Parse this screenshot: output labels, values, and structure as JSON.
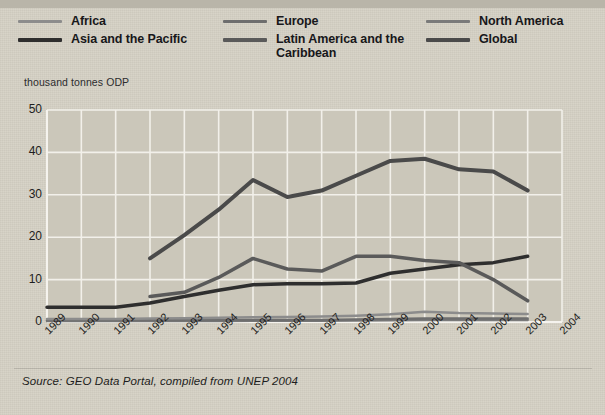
{
  "legend": {
    "columns": [
      [
        {
          "label": "Africa",
          "color": "#8c8c8c",
          "width": 3
        },
        {
          "label": "Asia and the Pacific",
          "color": "#2e2e2e",
          "width": 4
        }
      ],
      [
        {
          "label": "Europe",
          "color": "#6e6e6e",
          "width": 3
        },
        {
          "label": "Latin America and the\nCaribbean",
          "color": "#5a5a5a",
          "width": 4
        }
      ],
      [
        {
          "label": "North America",
          "color": "#7a7a7a",
          "width": 3
        },
        {
          "label": "Global",
          "color": "#4a4a4a",
          "width": 4
        }
      ]
    ]
  },
  "axis_unit": "thousand tonnes ODP",
  "source": "Source: GEO Data Portal, compiled from UNEP 2004",
  "chart_data": {
    "type": "line",
    "title": "",
    "subtitle": "",
    "xlabel": "",
    "ylabel": "thousand tonnes ODP",
    "ylim": [
      0,
      50
    ],
    "yticks": [
      0,
      10,
      20,
      30,
      40,
      50
    ],
    "grid": true,
    "legend_position": "top",
    "x": [
      1989,
      1990,
      1991,
      1992,
      1993,
      1994,
      1995,
      1996,
      1997,
      1998,
      1999,
      2000,
      2001,
      2002,
      2003,
      2004
    ],
    "xticks": [
      "1989",
      "1990",
      "1991",
      "1992",
      "1993",
      "1994",
      "1995",
      "1996",
      "1997",
      "1998",
      "1999",
      "2000",
      "2001",
      "2002",
      "2003",
      "2004"
    ],
    "series": [
      {
        "name": "Global",
        "color": "#4a4a4a",
        "width": 4,
        "x": [
          1992,
          1993,
          1994,
          1995,
          1996,
          1997,
          1998,
          1999,
          2000,
          2001,
          2002,
          2003
        ],
        "values": [
          15.0,
          20.5,
          26.5,
          33.5,
          29.5,
          31.0,
          34.5,
          38.0,
          38.5,
          36.0,
          35.5,
          31.0
        ]
      },
      {
        "name": "Latin America and the Caribbean",
        "color": "#5a5a5a",
        "width": 3.5,
        "x": [
          1992,
          1993,
          1994,
          1995,
          1996,
          1997,
          1998,
          1999,
          2000,
          2001,
          2002,
          2003
        ],
        "values": [
          6.0,
          7.0,
          10.5,
          15.0,
          12.5,
          12.0,
          15.5,
          15.5,
          14.5,
          14.0,
          10.0,
          5.0
        ]
      },
      {
        "name": "Asia and the Pacific",
        "color": "#2e2e2e",
        "width": 3.5,
        "x": [
          1989,
          1990,
          1991,
          1992,
          1993,
          1994,
          1995,
          1996,
          1997,
          1998,
          1999,
          2000,
          2001,
          2002,
          2003
        ],
        "values": [
          3.5,
          3.5,
          3.5,
          4.5,
          6.0,
          7.5,
          8.8,
          9.0,
          9.0,
          9.2,
          11.5,
          12.5,
          13.5,
          14.0,
          15.5
        ]
      },
      {
        "name": "Africa",
        "color": "#8c8c8c",
        "width": 2.5,
        "x": [
          1989,
          1990,
          1991,
          1992,
          1993,
          1994,
          1995,
          1996,
          1997,
          1998,
          1999,
          2000,
          2001,
          2002,
          2003
        ],
        "values": [
          0.7,
          0.7,
          0.7,
          0.8,
          0.9,
          1.0,
          1.1,
          1.2,
          1.3,
          1.5,
          1.8,
          2.4,
          2.1,
          2.0,
          1.9
        ]
      },
      {
        "name": "Europe",
        "color": "#6e6e6e",
        "width": 2.5,
        "x": [
          1989,
          1990,
          1991,
          1992,
          1993,
          1994,
          1995,
          1996,
          1997,
          1998,
          1999,
          2000,
          2001,
          2002,
          2003
        ],
        "values": [
          0.4,
          0.4,
          0.4,
          0.4,
          0.4,
          0.4,
          0.5,
          0.5,
          0.5,
          0.6,
          0.7,
          0.8,
          0.8,
          0.8,
          0.8
        ]
      },
      {
        "name": "North America",
        "color": "#7a7a7a",
        "width": 2.5,
        "x": [
          1989,
          1990,
          1991,
          1992,
          1993,
          1994,
          1995,
          1996,
          1997,
          1998,
          1999,
          2000,
          2001,
          2002,
          2003
        ],
        "values": [
          0.25,
          0.25,
          0.25,
          0.25,
          0.25,
          0.25,
          0.3,
          0.3,
          0.3,
          0.35,
          0.4,
          0.45,
          0.45,
          0.45,
          0.45
        ]
      }
    ]
  }
}
